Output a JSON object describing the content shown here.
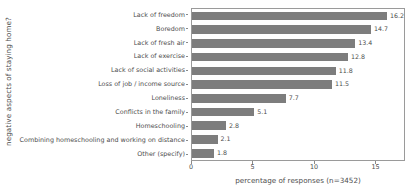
{
  "chart_data": {
    "type": "bar",
    "orientation": "horizontal",
    "title": "",
    "xlabel": "percentage of responses (n=3452)",
    "ylabel": "negative aspects of staying home?",
    "categories": [
      "Lack of freedom",
      "Boredom",
      "Lack of fresh air",
      "Lack of exercise",
      "Lack of social activities",
      "Loss of job / income source",
      "Loneliness",
      "Conflicts in the family",
      "Homeschooling",
      "Combining homeschooling and working on distance",
      "Other (specify)"
    ],
    "values": [
      16.2,
      14.7,
      13.4,
      12.8,
      11.8,
      11.5,
      7.7,
      5.1,
      2.8,
      2.1,
      1.8
    ],
    "value_labels": [
      "16.2",
      "14.7",
      "13.4",
      "12.8",
      "11.8",
      "11.5",
      "7.7",
      "5.1",
      "2.8",
      "2.1",
      "1.8"
    ],
    "xlim": [
      0,
      17.4
    ],
    "xticks": [
      0,
      5,
      10,
      15
    ],
    "xtick_labels": [
      "0",
      "5",
      "10",
      "15"
    ],
    "grid": false,
    "legend": "none",
    "bar_color": "#7d7d7d",
    "frame_color": "#9a9a9a",
    "text_color": "#4d4d4d",
    "background": "#ffffff"
  }
}
